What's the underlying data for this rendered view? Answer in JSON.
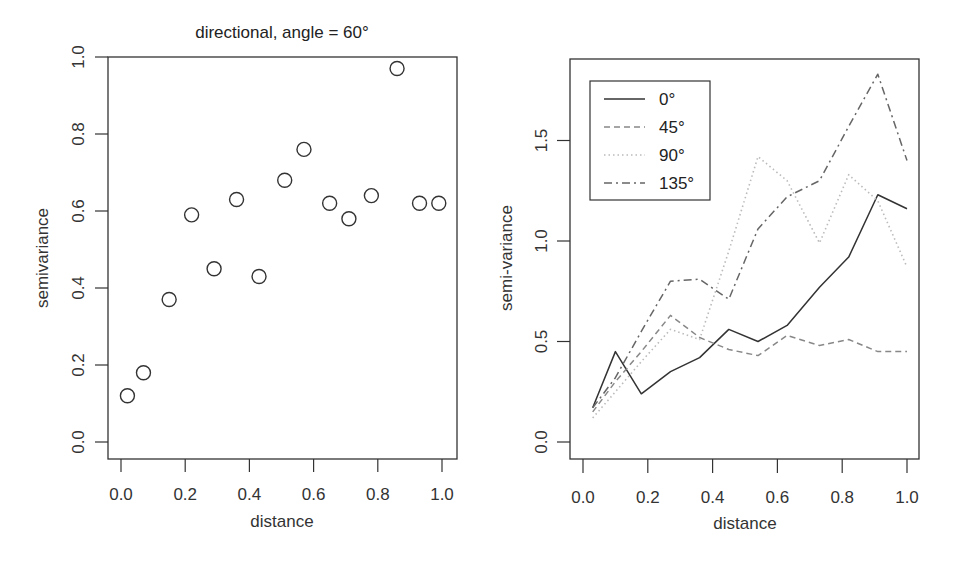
{
  "chart_data": [
    {
      "type": "scatter",
      "title": "directional, angle = 60°",
      "xlabel": "distance",
      "ylabel": "semivariance",
      "xlim": [
        -0.04,
        1.05
      ],
      "ylim": [
        -0.04,
        1.0
      ],
      "xticks": [
        "0.0",
        "0.2",
        "0.4",
        "0.6",
        "0.8",
        "1.0"
      ],
      "yticks": [
        "0.0",
        "0.2",
        "0.4",
        "0.6",
        "0.8",
        "1.0"
      ],
      "grid": false,
      "marker": "open-circle",
      "x": [
        0.02,
        0.07,
        0.15,
        0.22,
        0.29,
        0.36,
        0.43,
        0.51,
        0.57,
        0.65,
        0.71,
        0.78,
        0.86,
        0.93,
        0.99
      ],
      "y": [
        0.12,
        0.18,
        0.37,
        0.59,
        0.45,
        0.63,
        0.43,
        0.68,
        0.76,
        0.62,
        0.58,
        0.64,
        0.97,
        0.62,
        0.62
      ]
    },
    {
      "type": "line",
      "title": "",
      "xlabel": "distance",
      "ylabel": "semi-variance",
      "xlim": [
        -0.04,
        1.04
      ],
      "ylim": [
        -0.05,
        1.9
      ],
      "xticks": [
        "0.0",
        "0.2",
        "0.4",
        "0.6",
        "0.8",
        "1.0"
      ],
      "yticks": [
        "0.0",
        "0.5",
        "1.0",
        "1.5"
      ],
      "grid": false,
      "legend_position": "top-left",
      "x": [
        0.03,
        0.1,
        0.18,
        0.27,
        0.36,
        0.45,
        0.54,
        0.63,
        0.73,
        0.82,
        0.91,
        1.0
      ],
      "series": [
        {
          "name": "0°",
          "style": "solid",
          "color": "#333333",
          "values": [
            0.17,
            0.45,
            0.24,
            0.35,
            0.42,
            0.56,
            0.5,
            0.58,
            0.77,
            0.92,
            1.23,
            1.16
          ]
        },
        {
          "name": "45°",
          "style": "dashed",
          "color": "#888888",
          "values": [
            0.15,
            0.3,
            0.45,
            0.63,
            0.52,
            0.46,
            0.43,
            0.53,
            0.48,
            0.51,
            0.45,
            0.45
          ]
        },
        {
          "name": "90°",
          "style": "dotted",
          "color": "#bbbbbb",
          "values": [
            0.12,
            0.25,
            0.4,
            0.56,
            0.51,
            0.95,
            1.42,
            1.3,
            0.99,
            1.33,
            1.2,
            0.87
          ]
        },
        {
          "name": "135°",
          "style": "dashdot",
          "color": "#666666",
          "values": [
            0.17,
            0.32,
            0.55,
            0.8,
            0.81,
            0.71,
            1.06,
            1.22,
            1.3,
            1.57,
            1.83,
            1.4
          ]
        }
      ]
    }
  ],
  "left_panel": {
    "title": "directional, angle = 60°",
    "xlabel": "distance",
    "ylabel": "semivariance"
  },
  "right_panel": {
    "xlabel": "distance",
    "ylabel": "semi-variance",
    "legend": [
      "0°",
      "45°",
      "90°",
      "135°"
    ]
  }
}
